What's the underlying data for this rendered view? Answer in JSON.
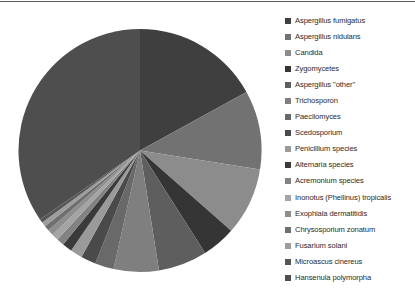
{
  "figure": {
    "background": "#ffffff",
    "rule_color": "#5a5a5a"
  },
  "legend": {
    "position": "right",
    "marker": "square"
  },
  "chart_data": {
    "type": "pie",
    "title": "",
    "subtitle": "",
    "xlabel": "",
    "ylabel": "",
    "grid": false,
    "legend_position": "right",
    "start_angle_deg": 0,
    "direction": "clockwise",
    "center_px": [
      139,
      150
    ],
    "radius_px": 121,
    "labels": [
      "Aspergillus fumigatus",
      "Aspergillus nidulans",
      "Candida",
      "Zygomycetes",
      "Aspergillus \"other\"",
      "Trichosporon",
      "Paecilomyces",
      "Scedosporium",
      "Penicillium species",
      "Alternaria species",
      "Acremonium species",
      "Inonotus (Phellinus) tropicalis",
      "Exophiala dermatitidis",
      "Chrysosporium zonatum",
      "Fusarium solani",
      "Microascus cinereus",
      "Hansenula polymorpha"
    ],
    "values": [
      17.0,
      10.5,
      9.0,
      4.5,
      6.5,
      6.0,
      2.5,
      2.0,
      1.6,
      1.3,
      1.0,
      0.9,
      0.8,
      0.7,
      0.6,
      0.5,
      34.6
    ],
    "colors": [
      "#3f3f3f",
      "#727272",
      "#8c8c8c",
      "#353535",
      "#5e5e5e",
      "#7f7f7f",
      "#696969",
      "#4a4a4a",
      "#9a9a9a",
      "#3a3a3a",
      "#828282",
      "#a4a4a4",
      "#8e8e8e",
      "#6f6f6f",
      "#9d9d9d",
      "#565656",
      "#4e4e4e"
    ]
  }
}
